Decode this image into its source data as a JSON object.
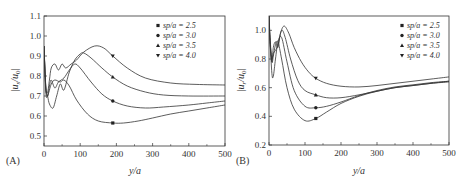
{
  "chart_data": [
    {
      "type": "line",
      "panel_label": "(A)",
      "title": "",
      "xlabel": "y/a",
      "ylabel": "|u_s/u_0|",
      "xlim": [
        0,
        500
      ],
      "ylim": [
        0.45,
        1.1
      ],
      "xticks": [
        0,
        100,
        200,
        300,
        400,
        500
      ],
      "yticks": [
        0.5,
        0.6,
        0.7,
        0.8,
        0.9,
        1.0,
        1.1
      ],
      "grid": false,
      "legend_position": "upper right",
      "series": [
        {
          "name": "sp/a=2.5",
          "marker": "square",
          "marker_at": [
            190,
            0.565
          ],
          "x": [
            0,
            5,
            10,
            20,
            30,
            45,
            55,
            70,
            90,
            120,
            150,
            190,
            220,
            260,
            300,
            350,
            400,
            450,
            500
          ],
          "values": [
            0.95,
            0.72,
            0.7,
            0.76,
            0.78,
            0.77,
            0.78,
            0.75,
            0.68,
            0.61,
            0.575,
            0.565,
            0.565,
            0.575,
            0.59,
            0.61,
            0.625,
            0.64,
            0.655
          ]
        },
        {
          "name": "sp/a=3.0",
          "marker": "circle",
          "marker_at": [
            190,
            0.675
          ],
          "x": [
            0,
            5,
            10,
            15,
            20,
            30,
            40,
            55,
            70,
            85,
            100,
            130,
            160,
            190,
            230,
            280,
            330,
            400,
            450,
            500
          ],
          "values": [
            0.95,
            0.74,
            0.7,
            0.75,
            0.78,
            0.74,
            0.77,
            0.79,
            0.83,
            0.86,
            0.84,
            0.77,
            0.71,
            0.675,
            0.65,
            0.64,
            0.645,
            0.655,
            0.665,
            0.675
          ]
        },
        {
          "name": "sp/a=3.5",
          "marker": "triangle-up",
          "marker_at": [
            190,
            0.795
          ],
          "x": [
            0,
            5,
            10,
            15,
            25,
            35,
            45,
            55,
            70,
            85,
            100,
            110,
            130,
            160,
            190,
            230,
            280,
            330,
            400,
            500
          ],
          "values": [
            0.95,
            0.75,
            0.7,
            0.66,
            0.64,
            0.7,
            0.76,
            0.73,
            0.82,
            0.88,
            0.91,
            0.915,
            0.89,
            0.84,
            0.795,
            0.75,
            0.72,
            0.705,
            0.7,
            0.7
          ]
        },
        {
          "name": "sp/a=4.0",
          "marker": "triangle-down",
          "marker_at": [
            190,
            0.9
          ],
          "x": [
            0,
            5,
            10,
            15,
            20,
            30,
            40,
            50,
            60,
            75,
            90,
            110,
            140,
            165,
            190,
            230,
            280,
            350,
            420,
            500
          ],
          "values": [
            0.95,
            0.74,
            0.72,
            0.78,
            0.84,
            0.86,
            0.83,
            0.86,
            0.84,
            0.86,
            0.88,
            0.92,
            0.95,
            0.94,
            0.9,
            0.84,
            0.79,
            0.765,
            0.758,
            0.755
          ]
        }
      ]
    },
    {
      "type": "line",
      "panel_label": "(B)",
      "title": "",
      "xlabel": "y/a",
      "ylabel": "|u_r/u_0|",
      "xlim": [
        0,
        500
      ],
      "ylim": [
        0.2,
        1.1
      ],
      "xticks": [
        0,
        100,
        200,
        300,
        400,
        500
      ],
      "yticks": [
        0.2,
        0.4,
        0.6,
        0.8,
        1.0
      ],
      "grid": false,
      "legend_position": "upper right",
      "series": [
        {
          "name": "sp/a=2.5",
          "marker": "square",
          "marker_at": [
            130,
            0.385
          ],
          "x": [
            0,
            3,
            8,
            12,
            18,
            25,
            35,
            50,
            70,
            100,
            130,
            160,
            200,
            250,
            300,
            350,
            400,
            450,
            500
          ],
          "values": [
            1.1,
            0.95,
            0.78,
            0.82,
            0.9,
            0.92,
            0.8,
            0.6,
            0.45,
            0.37,
            0.385,
            0.43,
            0.49,
            0.54,
            0.575,
            0.6,
            0.615,
            0.63,
            0.64
          ]
        },
        {
          "name": "sp/a=3.0",
          "marker": "circle",
          "marker_at": [
            130,
            0.46
          ],
          "x": [
            0,
            3,
            8,
            12,
            18,
            25,
            35,
            50,
            70,
            100,
            130,
            160,
            200,
            250,
            300,
            350,
            400,
            450,
            500
          ],
          "values": [
            1.1,
            0.93,
            0.7,
            0.68,
            0.8,
            0.92,
            0.95,
            0.78,
            0.58,
            0.47,
            0.46,
            0.47,
            0.5,
            0.545,
            0.58,
            0.605,
            0.62,
            0.635,
            0.645
          ]
        },
        {
          "name": "sp/a=3.5",
          "marker": "triangle-up",
          "marker_at": [
            130,
            0.55
          ],
          "x": [
            0,
            3,
            8,
            12,
            18,
            25,
            35,
            45,
            60,
            80,
            100,
            130,
            160,
            200,
            250,
            300,
            350,
            400,
            450,
            500
          ],
          "values": [
            1.1,
            0.92,
            0.8,
            0.84,
            0.86,
            0.9,
            1.0,
            0.95,
            0.8,
            0.65,
            0.58,
            0.55,
            0.53,
            0.53,
            0.55,
            0.575,
            0.6,
            0.615,
            0.63,
            0.645
          ]
        },
        {
          "name": "sp/a=4.0",
          "marker": "triangle-down",
          "marker_at": [
            130,
            0.665
          ],
          "x": [
            0,
            3,
            8,
            12,
            18,
            25,
            32,
            42,
            55,
            70,
            90,
            110,
            130,
            160,
            200,
            250,
            300,
            350,
            400,
            450,
            500
          ],
          "values": [
            1.1,
            0.9,
            0.78,
            0.88,
            0.92,
            0.88,
            0.98,
            1.03,
            0.98,
            0.88,
            0.78,
            0.71,
            0.665,
            0.63,
            0.61,
            0.605,
            0.615,
            0.63,
            0.645,
            0.66,
            0.675
          ]
        }
      ]
    }
  ],
  "panels": {
    "a": {
      "label": "(A)",
      "xlabel": "y/a",
      "ylabel_main": "|u",
      "ylabel_sub": "s",
      "ylabel_mid": "/u",
      "ylabel_sub2": "0",
      "ylabel_end": "|"
    },
    "b": {
      "label": "(B)",
      "xlabel": "y/a",
      "ylabel_main": "|u",
      "ylabel_sub": "r",
      "ylabel_mid": "/u",
      "ylabel_sub2": "0",
      "ylabel_end": "|"
    }
  },
  "legend": [
    "sp/a = 2.5",
    "sp/a = 3.0",
    "sp/a = 3.5",
    "sp/a = 4.0"
  ]
}
